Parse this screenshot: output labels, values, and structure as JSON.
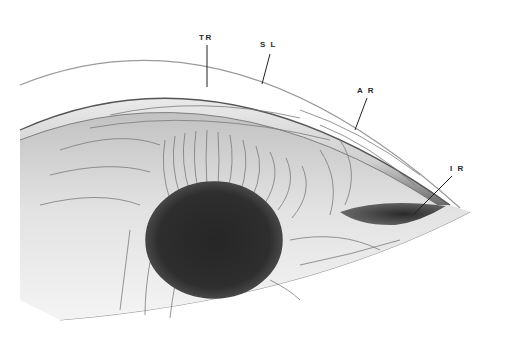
{
  "figure": {
    "type": "anatomical-illustration",
    "style": "grayscale pencil drawing",
    "labels": [
      {
        "id": "TR",
        "text": "TR",
        "x": 199,
        "y": 33,
        "lx1": 207,
        "ly1": 45,
        "lx2": 207,
        "ly2": 87
      },
      {
        "id": "SL",
        "text": "S L",
        "x": 260,
        "y": 40,
        "lx1": 270,
        "ly1": 54,
        "lx2": 262,
        "ly2": 84
      },
      {
        "id": "AR",
        "text": "A R",
        "x": 357,
        "y": 86,
        "lx1": 367,
        "ly1": 98,
        "lx2": 355,
        "ly2": 130
      },
      {
        "id": "IR",
        "text": "I R",
        "x": 450,
        "y": 164,
        "lx1": 452,
        "ly1": 176,
        "lx2": 413,
        "ly2": 215
      }
    ],
    "colors": {
      "outline": "#8a8a8a",
      "ink": "#2a2a2a",
      "shadow": "#1e1e1e",
      "tissue": "#d6d6d6",
      "background": "#ffffff"
    }
  }
}
